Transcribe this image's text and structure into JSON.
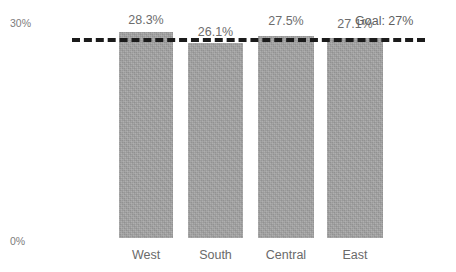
{
  "title_remnant": "",
  "chart_data": {
    "type": "bar",
    "title": "",
    "xlabel": "",
    "ylabel": "",
    "categories": [
      "West",
      "South",
      "Central",
      "East"
    ],
    "values": [
      28.3,
      26.1,
      27.5,
      27.1
    ],
    "value_labels": [
      "28.3%",
      "26.1%",
      "27.5%",
      "27.1%"
    ],
    "ylim": [
      0,
      30
    ],
    "ytick_labels": [
      "30%",
      "0%"
    ],
    "ytick_values": [
      30,
      0
    ],
    "grid": false,
    "legend": "none",
    "bar_color": "#a3a3a3",
    "reference_line": {
      "label": "Goal: 27%",
      "value": 27,
      "style": "dashed",
      "color": "#1b1b1b"
    }
  },
  "geometry": {
    "bars": [
      {
        "left": 119,
        "width": 54,
        "top": 32,
        "height": 206
      },
      {
        "left": 188,
        "width": 55,
        "top": 43,
        "height": 195
      },
      {
        "left": 258,
        "width": 56,
        "top": 36,
        "height": 202
      },
      {
        "left": 327,
        "width": 56,
        "top": 38,
        "height": 200
      }
    ],
    "value_label_positions": [
      {
        "left": 119,
        "width": 54,
        "top": 13
      },
      {
        "left": 188,
        "width": 55,
        "top": 25
      },
      {
        "left": 258,
        "width": 56,
        "top": 14
      },
      {
        "left": 327,
        "width": 56,
        "top": 17
      }
    ],
    "category_label_positions": [
      {
        "left": 119,
        "width": 54
      },
      {
        "left": 188,
        "width": 55
      },
      {
        "left": 258,
        "width": 56
      },
      {
        "left": 327,
        "width": 56
      }
    ],
    "goal_line": {
      "left": 72,
      "width": 353,
      "top": 38
    },
    "goal_label": {
      "left": 355,
      "top": 14
    }
  }
}
